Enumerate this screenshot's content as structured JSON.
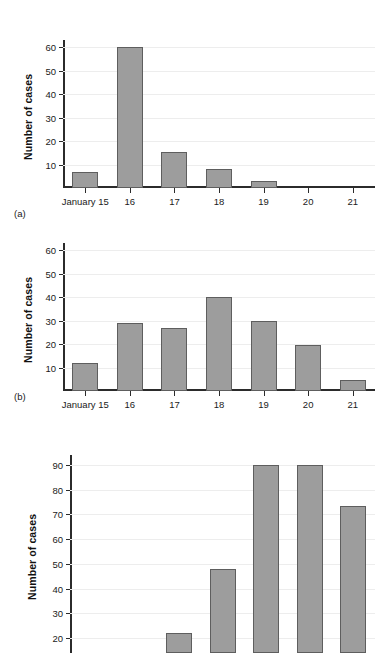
{
  "figure": {
    "panels": [
      {
        "id": "a",
        "caption": "(a)",
        "ylabel": "Number of cases",
        "yticks": [
          10,
          20,
          30,
          40,
          50,
          60
        ],
        "xlabels": [
          "January 15",
          "16",
          "17",
          "18",
          "19",
          "20",
          "21"
        ],
        "values": [
          7,
          60,
          15.5,
          8,
          3,
          0,
          0
        ]
      },
      {
        "id": "b",
        "caption": "(b)",
        "ylabel": "Number of cases",
        "yticks": [
          10,
          20,
          30,
          40,
          50,
          60
        ],
        "xlabels": [
          "January 15",
          "16",
          "17",
          "18",
          "19",
          "20",
          "21"
        ],
        "values": [
          12,
          29,
          27,
          40,
          30,
          19.5,
          4.5
        ]
      },
      {
        "id": "c",
        "caption": "",
        "ylabel": "Number of cases",
        "yticks": [
          20,
          30,
          40,
          50,
          60,
          70,
          80,
          90
        ],
        "xlabels": [
          "",
          "",
          "",
          "",
          "",
          "",
          ""
        ],
        "values": [
          0,
          0,
          22,
          48,
          90,
          90,
          73.5
        ]
      }
    ]
  },
  "chart_data": [
    {
      "type": "bar",
      "title": "(a)",
      "xlabel": "",
      "ylabel": "Number of cases",
      "categories": [
        "January 15",
        "16",
        "17",
        "18",
        "19",
        "20",
        "21"
      ],
      "values": [
        7,
        60,
        15.5,
        8,
        3,
        0,
        0
      ],
      "ylim": [
        0,
        63
      ],
      "yticks": [
        10,
        20,
        30,
        40,
        50,
        60
      ],
      "grid": true,
      "legend": "none",
      "bar_color": "#9d9d9d",
      "bar_edge_color": "#5e5e5e"
    },
    {
      "type": "bar",
      "title": "(b)",
      "xlabel": "",
      "ylabel": "Number of cases",
      "categories": [
        "January 15",
        "16",
        "17",
        "18",
        "19",
        "20",
        "21"
      ],
      "values": [
        12,
        29,
        27,
        40,
        30,
        19.5,
        4.5
      ],
      "ylim": [
        0,
        63
      ],
      "yticks": [
        10,
        20,
        30,
        40,
        50,
        60
      ],
      "grid": true,
      "legend": "none",
      "bar_color": "#9d9d9d",
      "bar_edge_color": "#5e5e5e"
    },
    {
      "type": "bar",
      "title": "",
      "xlabel": "",
      "ylabel": "Number of cases",
      "categories": [
        "",
        "",
        "",
        "",
        "",
        "",
        ""
      ],
      "values": [
        0,
        0,
        22,
        48,
        90,
        90,
        73.5
      ],
      "ylim": [
        14,
        94
      ],
      "yticks": [
        20,
        30,
        40,
        50,
        60,
        70,
        80,
        90
      ],
      "grid": true,
      "legend": "none",
      "bar_color": "#9d9d9d",
      "bar_edge_color": "#5e5e5e",
      "note": "panel is cropped at the bottom of the screenshot; x-axis line and tick labels are not visible"
    }
  ]
}
